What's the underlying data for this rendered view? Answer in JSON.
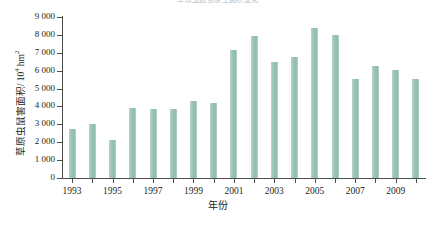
{
  "chart_data": {
    "type": "bar",
    "title": "草原虫鼠害发生面积变化",
    "xlabel": "年份",
    "ylabel": "草原虫鼠害面积/10⁴ hm²",
    "ylabel_base": "草原虫鼠害面积/ 10",
    "ylabel_exp": "4",
    "ylabel_unit": " hm",
    "ylabel_unit_exp": "2",
    "ylim": [
      0,
      9000
    ],
    "ytick_step": 1000,
    "grid": false,
    "legend": "none",
    "bar_color": "#9ec6b7",
    "axis_color": "#4d4d4d",
    "categories": [
      "1993",
      "1994",
      "1995",
      "1996",
      "1997",
      "1998",
      "1999",
      "2000",
      "2001",
      "2002",
      "2003",
      "2004",
      "2005",
      "2006",
      "2007",
      "2008",
      "2009",
      "2010"
    ],
    "values": [
      2720,
      3030,
      2110,
      3900,
      3860,
      3880,
      4300,
      4190,
      7130,
      7930,
      6480,
      6790,
      8370,
      7980,
      5540,
      6240,
      6020,
      5510
    ],
    "ytick_labels": [
      "0",
      "1 000",
      "2 000",
      "3 000",
      "4 000",
      "5 000",
      "6 000",
      "7 000",
      "8 000",
      "9 000"
    ],
    "ytick_values": [
      0,
      1000,
      2000,
      3000,
      4000,
      5000,
      6000,
      7000,
      8000,
      9000
    ],
    "xtick_labels": [
      "1993",
      "1995",
      "1997",
      "1999",
      "2001",
      "2003",
      "2005",
      "2007",
      "2009"
    ]
  }
}
